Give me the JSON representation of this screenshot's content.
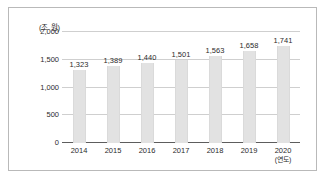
{
  "chart_data": {
    "type": "bar",
    "title": "",
    "xlabel": "(연도)",
    "ylabel": "(조 원)",
    "categories": [
      "2014",
      "2015",
      "2016",
      "2017",
      "2018",
      "2019",
      "2020"
    ],
    "values": [
      1323,
      1389,
      1440,
      1501,
      1563,
      1658,
      1741
    ],
    "value_labels": [
      "1,323",
      "1,389",
      "1,440",
      "1,501",
      "1,563",
      "1,658",
      "1,741"
    ],
    "ylim": [
      0,
      2000
    ],
    "yticks": [
      0,
      500,
      1000,
      1500,
      2000
    ],
    "ytick_labels": [
      "0",
      "500",
      "1,000",
      "1,500",
      "2,000"
    ],
    "grid": true,
    "legend": null,
    "colors": {
      "bar": "#e2e2e2",
      "gridline": "#cfcfcf",
      "axis": "#5d5d5d",
      "text": "#2b2b2b",
      "frame": "#b9b9b9"
    }
  }
}
